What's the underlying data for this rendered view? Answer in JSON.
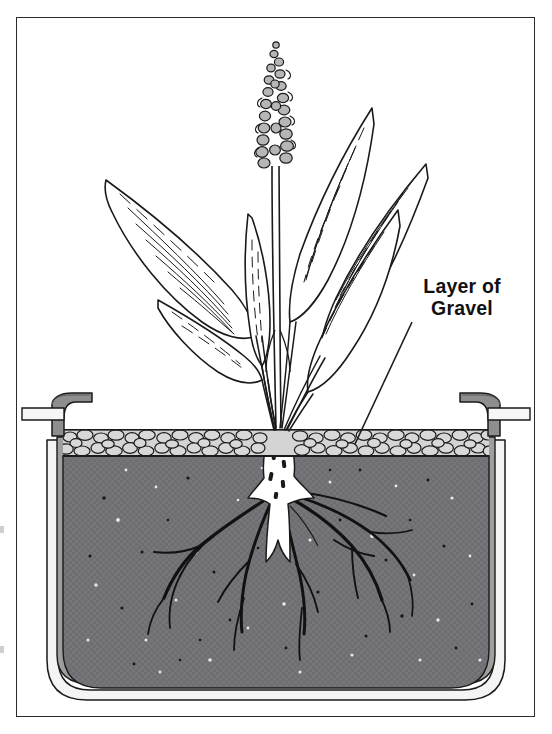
{
  "figure": {
    "kind": "botanical-cross-section-diagram",
    "background_color": "#ffffff",
    "border_color": "#2b2b2b"
  },
  "labels": {
    "gravel": {
      "line1": "Layer of",
      "line2": "Gravel",
      "text": "Layer of Gravel",
      "leader_from": [
        412,
        322
      ],
      "leader_to": [
        355,
        444
      ]
    }
  },
  "palette": {
    "outline": "#1a1a1a",
    "soil": "#76767a",
    "soil_speckle_light": "#e8e8e8",
    "soil_speckle_dark": "#1d1d1d",
    "gravel_fill": "#d0d0d0",
    "gravel_outline": "#1a1a1a",
    "pot_rim_gray": "#8e8e8e",
    "pot_wall_light": "#efefef",
    "pot_wall_mid": "#bdbdbd",
    "root_white": "#ffffff",
    "root_dark": "#111111",
    "leaf_fill": "#ffffff",
    "flower_fill": "#b6b6b6",
    "frame": "#2b2b2b"
  },
  "parts": [
    {
      "name": "flower-spike",
      "description": "tall tapering cluster of small gray florets at top of stem"
    },
    {
      "name": "stem",
      "description": "thin vertical double-line stalk"
    },
    {
      "name": "leaves",
      "description": "six large lance/arrowhead leaves with fine parallel veins"
    },
    {
      "name": "gravel-layer",
      "description": "band of packed rounded pebbles at soil surface"
    },
    {
      "name": "soil-body",
      "description": "dark gray speckled potting medium filling the container"
    },
    {
      "name": "root-crown",
      "description": "white rhizome/crown below gravel"
    },
    {
      "name": "roots",
      "description": "dark branching fibrous roots spreading through the soil"
    },
    {
      "name": "container",
      "description": "tapered pot with curled rim lip and layered walls"
    }
  ],
  "geometry": {
    "frame": {
      "x": 16,
      "y": 17,
      "w": 519,
      "h": 700
    },
    "gravel_band": {
      "top": 430,
      "bottom": 456
    },
    "soil_top": 456,
    "pot_bottom": 700,
    "pot_left_rim_x": 60,
    "pot_right_rim_x": 492
  }
}
